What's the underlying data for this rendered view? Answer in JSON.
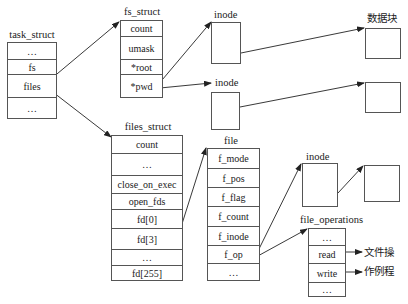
{
  "task_struct": {
    "title": "task_struct",
    "rows": [
      "…",
      "fs",
      "files",
      "…"
    ]
  },
  "fs_struct": {
    "title": "fs_struct",
    "rows": [
      "count",
      "umask",
      "*root",
      "*pwd"
    ]
  },
  "inode_root": {
    "title": "inode"
  },
  "inode_pwd": {
    "title": "inode"
  },
  "data_blocks": {
    "title": "数据块"
  },
  "files_struct": {
    "title": "files_struct",
    "rows": [
      "count",
      "…",
      "close_on_exec",
      "open_fds",
      "fd[0]",
      "fd[3]",
      "…",
      "fd[255]"
    ]
  },
  "file": {
    "title": "file",
    "rows": [
      "f_mode",
      "f_pos",
      "f_flag",
      "f_count",
      "f_inode",
      "f_op",
      "…"
    ]
  },
  "inode_file": {
    "title": "inode"
  },
  "file_operations": {
    "title": "file_operations",
    "rows": [
      "…",
      "read",
      "write",
      "…"
    ]
  },
  "routines_label": {
    "line1": "文件操",
    "line2": "作例程"
  }
}
